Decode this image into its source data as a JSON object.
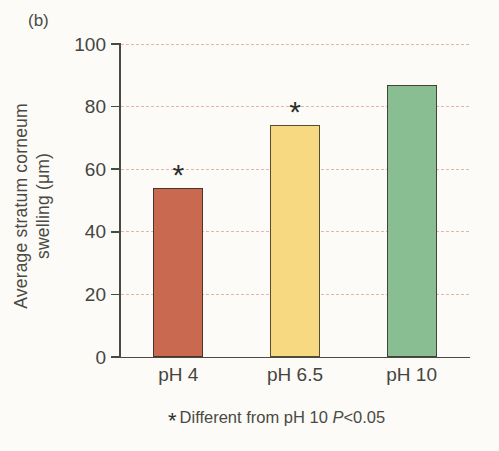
{
  "figure": {
    "panel_label": "(b)",
    "footnote": {
      "marker": "*",
      "before_p": "Different from pH 10 ",
      "p": "P",
      "after_p": "<0.05"
    }
  },
  "chart_data": {
    "type": "bar",
    "categories": [
      "pH 4",
      "pH 6.5",
      "pH 10"
    ],
    "values": [
      54,
      74,
      87
    ],
    "significance_markers": [
      "*",
      "*",
      ""
    ],
    "title": "",
    "xlabel": "",
    "ylabel_line1": "Average stratum corneum",
    "ylabel_line2": "swelling (μm)",
    "ylim": [
      0,
      100
    ],
    "yticks": [
      0,
      20,
      40,
      60,
      80,
      100
    ],
    "grid": "horizontal dashed at yticks (not at 0)",
    "legend": "none",
    "bar_colors": [
      "#c9694f",
      "#f6d980",
      "#89bd92"
    ],
    "bar_border_color": "#2d2820",
    "grid_color": "#dfab9a",
    "axis_color": "#4a4a44",
    "text_color": "#454540"
  }
}
